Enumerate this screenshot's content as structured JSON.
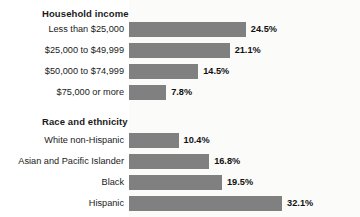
{
  "chart_data": {
    "type": "bar",
    "orientation": "horizontal",
    "title": "",
    "xlabel": "",
    "ylabel": "",
    "xlim": [
      0,
      32.1
    ],
    "grid": false,
    "legend": null,
    "value_suffix": "%",
    "bar_color": "#808080",
    "groups": [
      {
        "heading": "Household income",
        "categories": [
          "Less than $25,000",
          "$25,000 to $49,999",
          "$50,000 to $74,999",
          "$75,000 or more"
        ],
        "values": [
          24.5,
          21.1,
          14.5,
          7.8
        ],
        "value_labels": [
          "24.5%",
          "21.1%",
          "14.5%",
          "7.8%"
        ]
      },
      {
        "heading": "Race and ethnicity",
        "categories": [
          "White non-Hispanic",
          "Asian and Pacific Islander",
          "Black",
          "Hispanic"
        ],
        "values": [
          10.4,
          16.8,
          19.5,
          32.1
        ],
        "value_labels": [
          "10.4%",
          "16.8%",
          "19.5%",
          "32.1%"
        ]
      }
    ]
  }
}
